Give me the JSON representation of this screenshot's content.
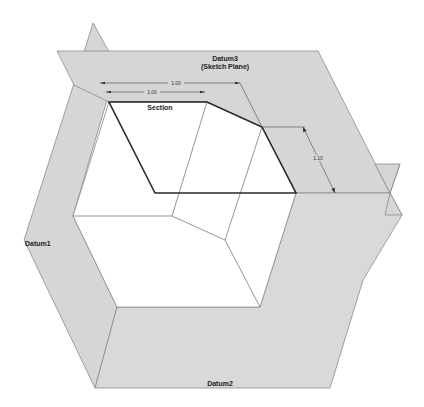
{
  "diagram": {
    "labels": {
      "datum3_line1": "Datum3",
      "datum3_line2": "(Sketch Plane)",
      "section": "Section",
      "datum1": "Datum1",
      "datum2": "Datum2"
    },
    "dimensions": {
      "top_outer": "1.00",
      "top_inner": "1.00",
      "right": "1.10"
    },
    "colors": {
      "plane_fill": "#d6d6d6",
      "plane_edge": "#8a8a8a",
      "section_line": "#2a2a2a",
      "background": "#ffffff"
    }
  }
}
